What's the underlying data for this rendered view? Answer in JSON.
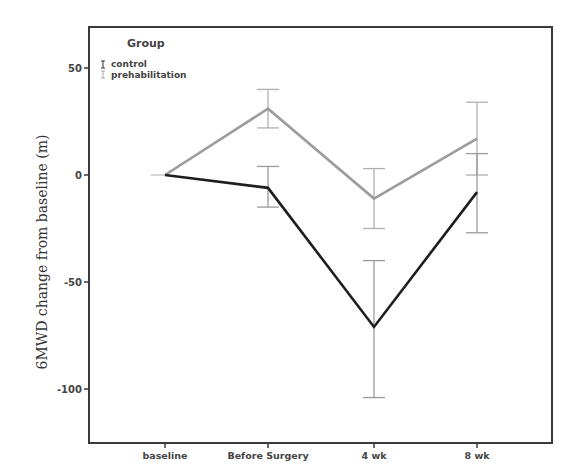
{
  "chart_data": {
    "type": "line",
    "title": "",
    "xlabel": "",
    "ylabel": "6MWD change from baseline (m)",
    "categories": [
      "baseline",
      "Before Surgery",
      "4 wk",
      "8 wk"
    ],
    "ylim": [
      -125,
      69
    ],
    "yticks": [
      50,
      0,
      -50,
      -100
    ],
    "ytick_labels": [
      "50",
      "0",
      "-50",
      "-100"
    ],
    "grid": false,
    "legend": {
      "title": "Group",
      "position": "upper left",
      "entries": [
        "control",
        "prehabilitation"
      ]
    },
    "series": [
      {
        "name": "control",
        "color": "#1e1e1e",
        "errorbar_color": "#9a9a9a",
        "values": [
          0,
          -6,
          -71,
          -8
        ],
        "upper": [
          0,
          4,
          -40,
          10
        ],
        "lower": [
          0,
          -15,
          -104,
          -27
        ]
      },
      {
        "name": "prehabilitation",
        "color": "#9c9c9c",
        "errorbar_color": "#b0b0b0",
        "values": [
          0,
          31,
          -11,
          17
        ],
        "upper": [
          0,
          40,
          3,
          34
        ],
        "lower": [
          0,
          22,
          -25,
          0
        ]
      }
    ]
  }
}
